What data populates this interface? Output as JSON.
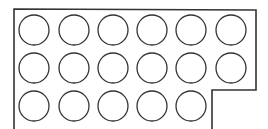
{
  "diagram": {
    "title": "",
    "stroke_color": "#333333",
    "background": "#ffffff",
    "outline": {
      "points": [
        [
          14,
          129
        ],
        [
          14,
          9
        ],
        [
          256,
          10
        ],
        [
          256,
          90
        ],
        [
          212,
          90
        ],
        [
          212,
          129
        ]
      ]
    },
    "circle_radius": 15,
    "rows": [
      {
        "y": 30,
        "xs": [
          34,
          74,
          113,
          152,
          191,
          231
        ]
      },
      {
        "y": 68,
        "xs": [
          34,
          74,
          113,
          152,
          191,
          231
        ]
      },
      {
        "y": 106,
        "xs": [
          34,
          74,
          113,
          152,
          191
        ]
      }
    ],
    "counts": {
      "row1": 6,
      "row2": 6,
      "row3": 5,
      "total": 17
    }
  }
}
